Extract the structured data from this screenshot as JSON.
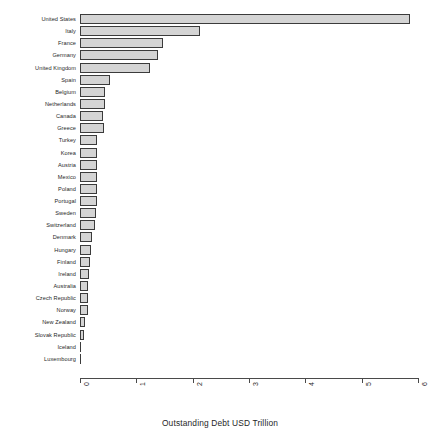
{
  "chart_data": {
    "type": "bar",
    "orientation": "horizontal",
    "title": "",
    "xlabel": "Outstanding Debt USD Trillion",
    "ylabel": "",
    "xlim": [
      0,
      6
    ],
    "xticks": [
      0,
      1,
      2,
      3,
      4,
      5,
      6
    ],
    "xtick_labels": [
      "0",
      "1",
      "2",
      "3",
      "4",
      "5",
      "6"
    ],
    "grid": false,
    "legend": false,
    "bar_fill_color": "#d4d4d4",
    "bar_border_color": "#3b3b3b",
    "categories": [
      "United States",
      "Italy",
      "France",
      "Germany",
      "United Kingdom",
      "Spain",
      "Belgium",
      "Netherlands",
      "Canada",
      "Greece",
      "Turkey",
      "Korea",
      "Austria",
      "Mexico",
      "Poland",
      "Portugal",
      "Sweden",
      "Switzerland",
      "Denmark",
      "Hungary",
      "Finland",
      "Ireland",
      "Australia",
      "Czech Republic",
      "Norway",
      "New Zealand",
      "Slovak Republic",
      "Iceland",
      "Luxembourg"
    ],
    "values": [
      5.86,
      2.13,
      1.48,
      1.38,
      1.25,
      0.53,
      0.44,
      0.44,
      0.41,
      0.42,
      0.31,
      0.3,
      0.3,
      0.3,
      0.3,
      0.31,
      0.29,
      0.26,
      0.22,
      0.2,
      0.17,
      0.16,
      0.15,
      0.14,
      0.14,
      0.08,
      0.07,
      0.02,
      0.02
    ]
  }
}
